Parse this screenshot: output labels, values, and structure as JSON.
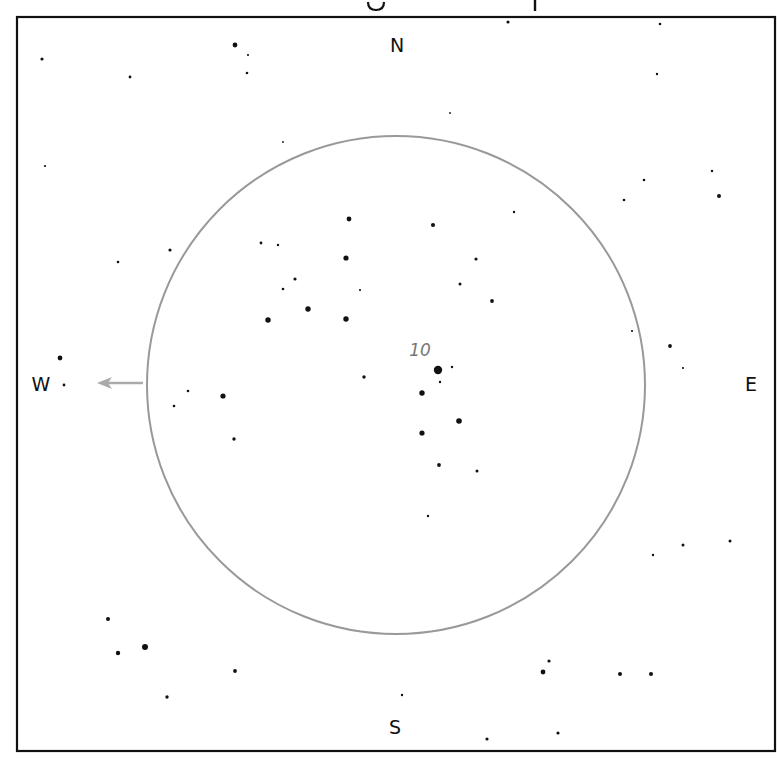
{
  "title": {
    "text": "Finding chart — clipped at top (only descenders visible)"
  },
  "frame": {
    "x": 17,
    "y": 17,
    "width": 758,
    "height": 734,
    "stroke": "#111111"
  },
  "field_circle": {
    "cx": 396,
    "cy": 385,
    "r": 249,
    "stroke": "#999999"
  },
  "directions": {
    "north": {
      "label": "N",
      "x": 397,
      "y": 52
    },
    "south": {
      "label": "S",
      "x": 395,
      "y": 734
    },
    "west": {
      "label": "W",
      "x": 41,
      "y": 391
    },
    "east": {
      "label": "E",
      "x": 751,
      "y": 391
    }
  },
  "object_label": {
    "text": "10",
    "x": 420,
    "y": 356,
    "color": "#777777"
  },
  "motion_arrow": {
    "x1": 143,
    "y1": 383,
    "x2": 97,
    "y2": 383,
    "color": "#aaaaaa",
    "direction": "west"
  },
  "stars": [
    {
      "x": 42,
      "y": 59,
      "r": 1.6
    },
    {
      "x": 130,
      "y": 77,
      "r": 1.4
    },
    {
      "x": 235,
      "y": 45,
      "r": 2.4
    },
    {
      "x": 248,
      "y": 55,
      "r": 1.1
    },
    {
      "x": 247,
      "y": 73,
      "r": 1.3
    },
    {
      "x": 508,
      "y": 22,
      "r": 1.6
    },
    {
      "x": 660,
      "y": 24,
      "r": 1.3
    },
    {
      "x": 657,
      "y": 74,
      "r": 1.2
    },
    {
      "x": 450,
      "y": 113,
      "r": 0.9
    },
    {
      "x": 283,
      "y": 142,
      "r": 0.9
    },
    {
      "x": 45,
      "y": 166,
      "r": 1.1
    },
    {
      "x": 644,
      "y": 180,
      "r": 1.3
    },
    {
      "x": 712,
      "y": 171,
      "r": 1.2
    },
    {
      "x": 719,
      "y": 196,
      "r": 2.0
    },
    {
      "x": 624,
      "y": 200,
      "r": 1.3
    },
    {
      "x": 514,
      "y": 212,
      "r": 1.2
    },
    {
      "x": 118,
      "y": 262,
      "r": 1.3
    },
    {
      "x": 170,
      "y": 250,
      "r": 1.6
    },
    {
      "x": 349,
      "y": 219,
      "r": 2.4
    },
    {
      "x": 433,
      "y": 225,
      "r": 2.1
    },
    {
      "x": 261,
      "y": 243,
      "r": 1.4
    },
    {
      "x": 278,
      "y": 245,
      "r": 1.2
    },
    {
      "x": 346,
      "y": 258,
      "r": 2.6
    },
    {
      "x": 476,
      "y": 259,
      "r": 1.6
    },
    {
      "x": 295,
      "y": 279,
      "r": 1.6
    },
    {
      "x": 283,
      "y": 289,
      "r": 1.3
    },
    {
      "x": 360,
      "y": 290,
      "r": 1.1
    },
    {
      "x": 460,
      "y": 284,
      "r": 1.5
    },
    {
      "x": 492,
      "y": 301,
      "r": 1.9
    },
    {
      "x": 308,
      "y": 309,
      "r": 2.7
    },
    {
      "x": 268,
      "y": 320,
      "r": 2.7
    },
    {
      "x": 346,
      "y": 319,
      "r": 2.7
    },
    {
      "x": 632,
      "y": 331,
      "r": 1.1
    },
    {
      "x": 670,
      "y": 346,
      "r": 1.9
    },
    {
      "x": 683,
      "y": 368,
      "r": 1.1
    },
    {
      "x": 60,
      "y": 358,
      "r": 2.4
    },
    {
      "x": 64,
      "y": 385,
      "r": 1.4
    },
    {
      "x": 188,
      "y": 391,
      "r": 1.3
    },
    {
      "x": 174,
      "y": 406,
      "r": 1.3
    },
    {
      "x": 223,
      "y": 396,
      "r": 2.6
    },
    {
      "x": 234,
      "y": 439,
      "r": 1.7
    },
    {
      "x": 364,
      "y": 377,
      "r": 1.7
    },
    {
      "x": 438,
      "y": 370,
      "r": 4.2
    },
    {
      "x": 452,
      "y": 367,
      "r": 1.2
    },
    {
      "x": 440,
      "y": 382,
      "r": 1.2
    },
    {
      "x": 422,
      "y": 393,
      "r": 2.7
    },
    {
      "x": 459,
      "y": 421,
      "r": 2.8
    },
    {
      "x": 422,
      "y": 433,
      "r": 2.6
    },
    {
      "x": 439,
      "y": 465,
      "r": 1.9
    },
    {
      "x": 477,
      "y": 471,
      "r": 1.5
    },
    {
      "x": 428,
      "y": 516,
      "r": 1.2
    },
    {
      "x": 653,
      "y": 555,
      "r": 1.2
    },
    {
      "x": 683,
      "y": 545,
      "r": 1.5
    },
    {
      "x": 730,
      "y": 541,
      "r": 1.5
    },
    {
      "x": 108,
      "y": 619,
      "r": 2.0
    },
    {
      "x": 118,
      "y": 653,
      "r": 2.2
    },
    {
      "x": 145,
      "y": 647,
      "r": 3.0
    },
    {
      "x": 235,
      "y": 671,
      "r": 1.9
    },
    {
      "x": 167,
      "y": 697,
      "r": 1.7
    },
    {
      "x": 549,
      "y": 661,
      "r": 1.6
    },
    {
      "x": 543,
      "y": 672,
      "r": 2.4
    },
    {
      "x": 620,
      "y": 674,
      "r": 2.0
    },
    {
      "x": 651,
      "y": 674,
      "r": 2.0
    },
    {
      "x": 402,
      "y": 695,
      "r": 1.2
    },
    {
      "x": 487,
      "y": 739,
      "r": 1.6
    },
    {
      "x": 558,
      "y": 733,
      "r": 1.6
    }
  ]
}
